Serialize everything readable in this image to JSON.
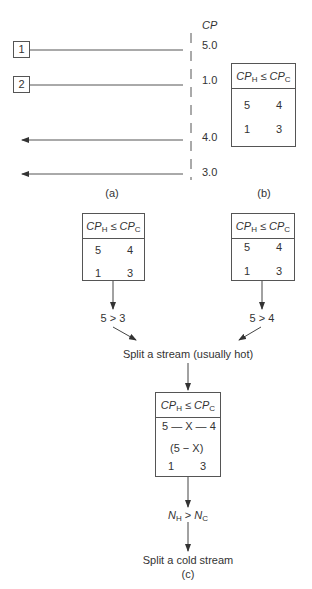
{
  "panel_a": {
    "cp_header": "CP",
    "streams": [
      {
        "id": "1",
        "kind": "hot",
        "cp": "5.0"
      },
      {
        "id": "2",
        "kind": "hot",
        "cp": "1.0"
      },
      {
        "id": "",
        "kind": "cold",
        "cp": "4.0"
      },
      {
        "id": "",
        "kind": "cold",
        "cp": "3.0"
      }
    ],
    "label": "(a)"
  },
  "panel_b": {
    "header_left": "CP",
    "header_left_sub": "H",
    "header_op": "≤",
    "header_right": "CP",
    "header_right_sub": "C",
    "rows": [
      [
        "5",
        "4"
      ],
      [
        "1",
        "3"
      ]
    ],
    "label": "(b)"
  },
  "panel_c": {
    "left_box": {
      "header_left": "CP",
      "header_left_sub": "H",
      "header_op": "≤",
      "header_right": "CP",
      "header_right_sub": "C",
      "values": [
        "5",
        "4",
        "1",
        "3"
      ],
      "note": "crossed matching"
    },
    "right_box": {
      "header_left": "CP",
      "header_left_sub": "H",
      "header_op": "≤",
      "header_right": "CP",
      "header_right_sub": "C",
      "row1": [
        "5",
        "—",
        "4"
      ],
      "row2": [
        "1",
        "—",
        "3"
      ]
    },
    "left_condition": "5 > 3",
    "right_condition": "5 > 4",
    "split_hot": "Split a stream (usually hot)",
    "bottom_box": {
      "header_left": "CP",
      "header_left_sub": "H",
      "header_op": "≤",
      "header_right": "CP",
      "header_right_sub": "C",
      "row1": "5 — X — 4",
      "row2": "(5 − X)",
      "row3_left": "1",
      "row3_right": "3"
    },
    "n_condition_left": "N",
    "n_condition_left_sub": "H",
    "n_condition_op": ">",
    "n_condition_right": "N",
    "n_condition_right_sub": "C",
    "split_cold": "Split a cold stream",
    "label": "(c)"
  },
  "colors": {
    "line": "#444444",
    "text": "#333333",
    "background": "#ffffff"
  }
}
